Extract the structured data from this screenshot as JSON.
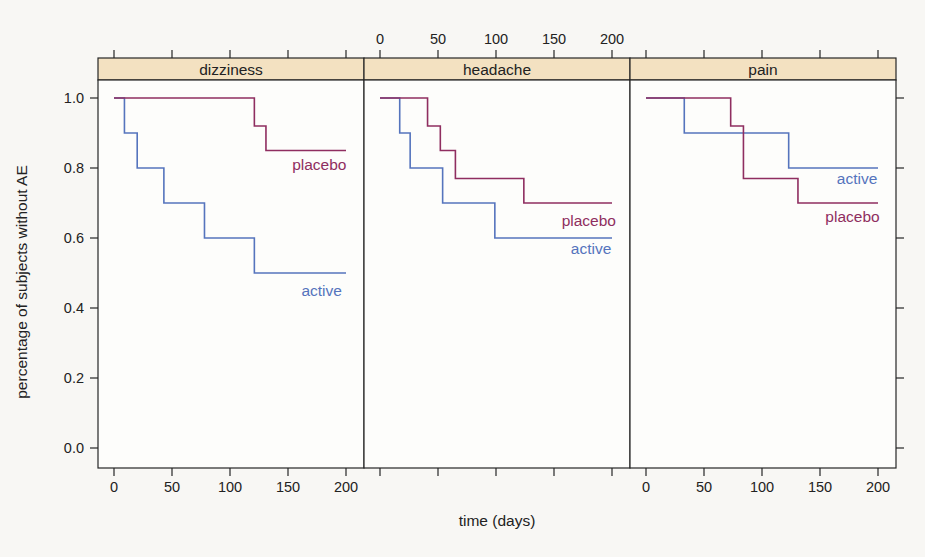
{
  "figure": {
    "x_axis_title": "time (days)",
    "y_axis_title": "percentage of subjects without AE"
  },
  "colors": {
    "placebo": "#8f2e60",
    "active": "#5574bd",
    "strip_fill": "#f3e1c1",
    "frame": "#262626",
    "page_background": "#f8f7f4",
    "panel_background": "#fdfdfb"
  },
  "chart_data": {
    "type": "line",
    "variant": "kaplan-meier-step-trellis",
    "title": "",
    "xlabel": "time (days)",
    "ylabel": "percentage of subjects without AE",
    "x_ticks": [
      0,
      50,
      100,
      150,
      200
    ],
    "y_ticks": [
      0.0,
      0.2,
      0.4,
      0.6,
      0.8,
      1.0
    ],
    "xlim": [
      0,
      200
    ],
    "ylim": [
      0.0,
      1.0
    ],
    "grid": false,
    "layout_hints": {
      "panels_in_row": 3,
      "top_axis_labels_above_panel": "headache",
      "bottom_axis_labels_below_panels": [
        "dizziness",
        "pain"
      ],
      "y_labels_left_of_panel": "dizziness",
      "y_ticks_unlabeled_right_of_panel": "pain",
      "legend": "direct in-panel line labels"
    },
    "panels": [
      {
        "strip_label": "dizziness",
        "series": [
          {
            "name": "active",
            "color_key": "active",
            "steps": [
              [
                0,
                1.0
              ],
              [
                9,
                0.9
              ],
              [
                20,
                0.8
              ],
              [
                43,
                0.7
              ],
              [
                78,
                0.6
              ],
              [
                121,
                0.5
              ]
            ],
            "end_day": 200,
            "label": {
              "text": "active",
              "day": 179,
              "value": 0.45
            }
          },
          {
            "name": "placebo",
            "color_key": "placebo",
            "steps": [
              [
                0,
                1.0
              ],
              [
                121,
                0.92
              ],
              [
                131,
                0.85
              ]
            ],
            "end_day": 200,
            "label": {
              "text": "placebo",
              "day": 177,
              "value": 0.81
            }
          }
        ]
      },
      {
        "strip_label": "headache",
        "series": [
          {
            "name": "active",
            "color_key": "active",
            "steps": [
              [
                0,
                1.0
              ],
              [
                17,
                0.9
              ],
              [
                26,
                0.8
              ],
              [
                54,
                0.7
              ],
              [
                99,
                0.6
              ]
            ],
            "end_day": 200,
            "label": {
              "text": "active",
              "day": 182,
              "value": 0.57
            }
          },
          {
            "name": "placebo",
            "color_key": "placebo",
            "steps": [
              [
                0,
                1.0
              ],
              [
                41,
                0.92
              ],
              [
                52,
                0.85
              ],
              [
                65,
                0.77
              ],
              [
                124,
                0.7
              ]
            ],
            "end_day": 200,
            "label": {
              "text": "placebo",
              "day": 180,
              "value": 0.65
            }
          }
        ]
      },
      {
        "strip_label": "pain",
        "series": [
          {
            "name": "active",
            "color_key": "active",
            "steps": [
              [
                0,
                1.0
              ],
              [
                33,
                0.9
              ],
              [
                123,
                0.8
              ]
            ],
            "end_day": 200,
            "label": {
              "text": "active",
              "day": 182,
              "value": 0.77
            }
          },
          {
            "name": "placebo",
            "color_key": "placebo",
            "steps": [
              [
                0,
                1.0
              ],
              [
                73,
                0.92
              ],
              [
                84,
                0.77
              ],
              [
                131,
                0.7
              ]
            ],
            "end_day": 200,
            "label": {
              "text": "placebo",
              "day": 178,
              "value": 0.66
            }
          }
        ]
      }
    ]
  }
}
